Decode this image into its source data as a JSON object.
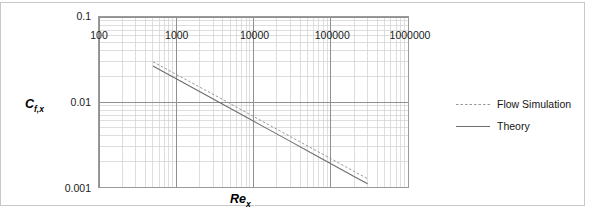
{
  "chart_data": {
    "type": "line",
    "title": "",
    "xlabel": "Re_x",
    "ylabel": "C_f,x",
    "xscale": "log",
    "yscale": "log",
    "xlim": [
      100,
      1000000
    ],
    "ylim": [
      0.001,
      0.1
    ],
    "grid": true,
    "grid_minor": true,
    "legend_position": "right",
    "x_tick_labels": [
      "100",
      "1000",
      "10000",
      "100000",
      "1000000"
    ],
    "x_tick_values": [
      100,
      1000,
      10000,
      100000,
      1000000
    ],
    "y_tick_labels": [
      "0.1",
      "0.01",
      "0.001"
    ],
    "y_tick_values": [
      0.1,
      0.01,
      0.001
    ],
    "series": [
      {
        "name": "Flow Simulation",
        "style": "dashed",
        "color": "#8c8c8c",
        "x": [
          500,
          700,
          1000,
          2000,
          4000,
          8000,
          15000,
          30000,
          60000,
          120000,
          200000,
          300000
        ],
        "y": [
          0.0297,
          0.0252,
          0.0211,
          0.015,
          0.0107,
          0.00755,
          0.00552,
          0.00392,
          0.00278,
          0.00197,
          0.00153,
          0.00125
        ]
      },
      {
        "name": "Theory",
        "style": "solid",
        "color": "#6e6e6e",
        "x": [
          500,
          700,
          1000,
          2000,
          4000,
          8000,
          15000,
          30000,
          60000,
          120000,
          200000,
          300000
        ],
        "y": [
          0.0265,
          0.0224,
          0.0188,
          0.0133,
          0.0094,
          0.00665,
          0.00486,
          0.00344,
          0.00243,
          0.00172,
          0.00133,
          0.00109
        ]
      }
    ]
  },
  "axes": {
    "x_title": "Re",
    "x_title_sub": "x",
    "y_title": "C",
    "y_title_sub": "f,x"
  },
  "legend": {
    "items": [
      {
        "label": "Flow Simulation",
        "style": "dashed"
      },
      {
        "label": "Theory",
        "style": "solid"
      }
    ]
  }
}
